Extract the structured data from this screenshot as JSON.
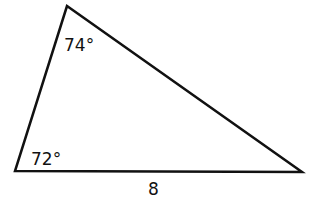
{
  "figure": {
    "shape": "triangle",
    "stroke_color": "#111111",
    "background": "#ffffff",
    "vertices": {
      "top": [
        67,
        6
      ],
      "bottom_left": [
        15,
        171
      ],
      "bottom_right": [
        302,
        172
      ]
    },
    "angles": {
      "top": "74°",
      "bottom_left": "72°"
    },
    "sides": {
      "bottom": "8"
    }
  }
}
